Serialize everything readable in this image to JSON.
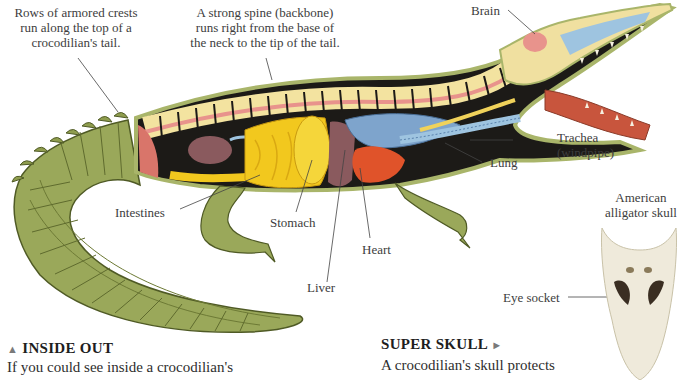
{
  "captions": {
    "crests": [
      "Rows of armored crests",
      "run along the top of a",
      "crocodilian's tail."
    ],
    "spine": [
      "A strong spine (backbone)",
      "runs right from the base of",
      "the neck to the tip of the tail."
    ]
  },
  "labels": {
    "brain": "Brain",
    "trachea": [
      "Trachea",
      "(windpipe)"
    ],
    "lung": "Lung",
    "intestines": "Intestines",
    "stomach": "Stomach",
    "heart": "Heart",
    "liver": "Liver",
    "skull_title": [
      "American",
      "alligator skull"
    ],
    "eye_socket": "Eye socket"
  },
  "sections": {
    "inside_out": {
      "marker": "▲",
      "heading": "INSIDE OUT",
      "text": "If you could see inside a crocodilian's"
    },
    "super_skull": {
      "heading": "SUPER SKULL",
      "marker": "►",
      "text": "A crocodilian's skull protects"
    }
  },
  "colors": {
    "scales": "#9aa85a",
    "scales_dark": "#5f6b2e",
    "spine_bone": "#f3e3a0",
    "spinal_cord": "#e8938c",
    "body_cavity": "#1c1a17",
    "intestines": "#f2c81e",
    "lung": "#7ea4cc",
    "heart": "#e0532a",
    "liver": "#8a5a5e",
    "skull": "#efeadb"
  }
}
